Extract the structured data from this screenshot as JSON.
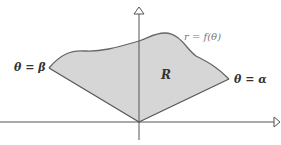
{
  "figure": {
    "labels": {
      "theta_beta": "θ = β",
      "theta_alpha": "θ = α",
      "curve": "r = f(θ)",
      "region": "R"
    },
    "colors": {
      "region_fill": "#d6d6d6",
      "curve_stroke": "#666666",
      "axis_stroke": "#555555",
      "label_text": "#333333"
    }
  }
}
